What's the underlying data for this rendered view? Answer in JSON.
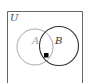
{
  "diagram": {
    "type": "venn",
    "universe_label": "U",
    "sets": [
      {
        "label": "A",
        "color": "#9a9a9a"
      },
      {
        "label": "B",
        "color": "#333333"
      }
    ],
    "marker": {
      "shape": "square",
      "color": "#000000",
      "region": "A ∩ B"
    },
    "border_color": "#666666"
  }
}
